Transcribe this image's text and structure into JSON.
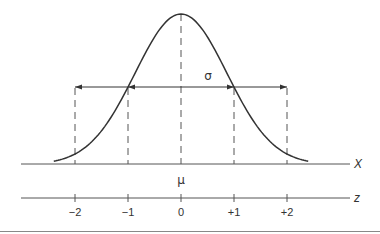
{
  "diagram": {
    "colors": {
      "curve": "#333333",
      "axis": "#555555",
      "dash": "#555555",
      "arrow": "#333333",
      "text": "#333333",
      "rule": "#888888"
    },
    "labels": {
      "sigma": "σ",
      "mu": "μ",
      "x_axis": "X",
      "z_axis": "z"
    },
    "z_ticks": [
      {
        "value": -2,
        "label": "−2"
      },
      {
        "value": -1,
        "label": "−1"
      },
      {
        "value": 0,
        "label": "0"
      },
      {
        "value": 1,
        "label": "+1"
      },
      {
        "value": 2,
        "label": "+2"
      }
    ],
    "arrows": [
      {
        "from": 0,
        "to": -1
      },
      {
        "from": -1,
        "to": -2
      },
      {
        "from": 0,
        "to": 1
      },
      {
        "from": 1,
        "to": 2
      }
    ]
  },
  "chart_data": {
    "type": "line",
    "title": "",
    "xlabel": "X",
    "secondary_xlabel": "z",
    "x_range": [
      -2.4,
      2.4
    ],
    "z_ticks": [
      -2,
      -1,
      0,
      1,
      2
    ],
    "mean_label": "μ",
    "sd_label": "σ",
    "grid": false,
    "series": [
      {
        "name": "normal density",
        "function": "exp(-z^2/2)",
        "x_min": -2.4,
        "x_max": 2.4
      }
    ]
  },
  "layout": {
    "center_x": 181,
    "sigma_px": 53,
    "peak_y": 14,
    "base_y": 164.5,
    "height_px": 150.5,
    "shape_k": 1.33,
    "arrow_y": 87,
    "x_axis_y": 164,
    "z_axis_y": 198,
    "axis_x0": 21,
    "axis_x1": 350
  }
}
